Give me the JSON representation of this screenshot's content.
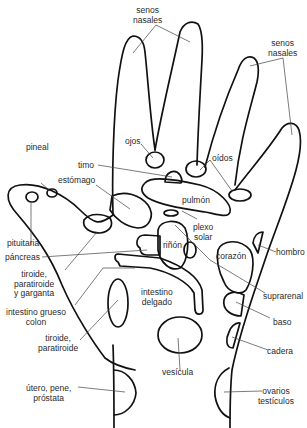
{
  "diagram": {
    "type": "hand reflexology map",
    "language": "es"
  },
  "labels": {
    "senos_nasales_1": "senos\nnasales",
    "senos_nasales_2": "senos\nnasales",
    "pineal": "pineal",
    "ojos": "ojos",
    "timo": "timo",
    "oidos": "oídos",
    "estomago": "estómago",
    "pulmon": "pulmón",
    "pituitaria": "pituitaria",
    "plexo_solar": "plexo\nsolar",
    "pancreas": "páncreas",
    "rinon": "riñón",
    "hombro": "hombro",
    "corazon": "corazón",
    "tiroide_garganta": "tiroide,\nparatiroide\ny garganta",
    "suprarenal": "suprarenal",
    "intestino_delgado": "intestino\ndelgado",
    "intestino_grueso": "intestino grueso\ncolon",
    "baso": "baso",
    "tiroide_paratiroide": "tiroide,\nparatiroide",
    "cadera": "cadera",
    "vesicula": "vesícula",
    "utero": "útero, pene,\npróstata",
    "ovarios": "ovarios\ntestículos"
  }
}
